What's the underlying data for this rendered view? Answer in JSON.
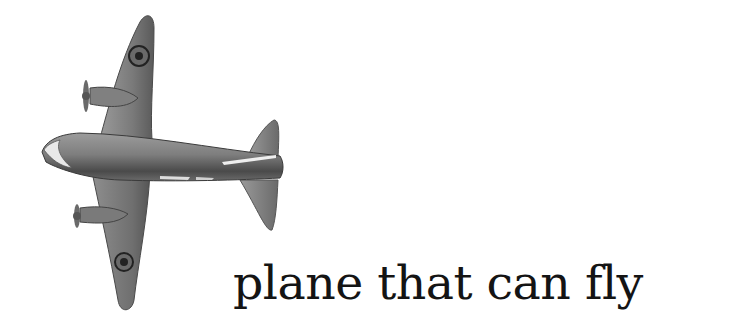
{
  "image": {
    "subject": "toy-plane-illustration",
    "caption": "plane that can fly",
    "background_color": "#ffffff",
    "plane_colors": {
      "body": "#8a8a8a",
      "shadow": "#3f3f3f",
      "highlight": "#e6e6e6",
      "roundel": "#2a2a2a"
    }
  }
}
